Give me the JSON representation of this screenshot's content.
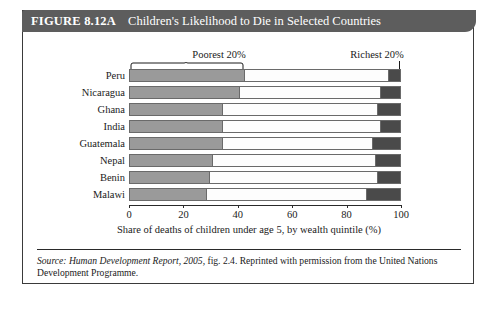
{
  "figure": {
    "number_label": "FIGURE 8.12A",
    "title": "Children's Likelihood to Die in Selected Countries"
  },
  "annotations": {
    "poorest_label": "Poorest 20%",
    "richest_label": "Richest 20%"
  },
  "source": {
    "prefix": "Source: ",
    "italic_part": "Human Development Report, 2005,",
    "rest": " fig. 2.4. Reprinted with permission from the United Nations Development Programme."
  },
  "colors": {
    "banner": "#5d5d5d",
    "poorest_quintile": "#9a9a9a",
    "middle_quintiles": "#fdfdfd",
    "richest_quintile": "#4a4a4a",
    "bar_outline": "#6a6a6a",
    "frame": "#3a3a3a"
  },
  "chart_data": {
    "type": "bar",
    "orientation": "horizontal",
    "stacked": true,
    "title": "Children's Likelihood to Die in Selected Countries",
    "xlabel": "Share of deaths of children under age 5, by wealth quintile (%)",
    "ylabel": "",
    "xlim": [
      0,
      100
    ],
    "xticks": [
      0,
      20,
      40,
      60,
      80,
      100
    ],
    "xtick_labels": [
      "0",
      "20",
      "40",
      "60",
      "80",
      "100"
    ],
    "grid": false,
    "legend_position": "above-plot-annotations",
    "categories": [
      "Peru",
      "Nicaragua",
      "Ghana",
      "India",
      "Guatemala",
      "Nepal",
      "Benin",
      "Malawi"
    ],
    "series": [
      {
        "name": "Poorest 20%",
        "color": "#9a9a9a",
        "values": [
          42,
          40,
          34,
          34,
          34,
          30,
          29,
          28
        ]
      },
      {
        "name": "Middle 60%",
        "color": "#fdfdfd",
        "values": [
          54,
          53,
          58,
          59,
          56,
          61,
          63,
          60
        ]
      },
      {
        "name": "Richest 20%",
        "color": "#4a4a4a",
        "values": [
          4,
          7,
          8,
          7,
          10,
          9,
          8,
          12
        ]
      }
    ],
    "annotations": [
      "Poorest 20%",
      "Richest 20%"
    ],
    "source_note": "Source: Human Development Report, 2005, fig. 2.4. Reprinted with permission from the United Nations Development Programme."
  }
}
